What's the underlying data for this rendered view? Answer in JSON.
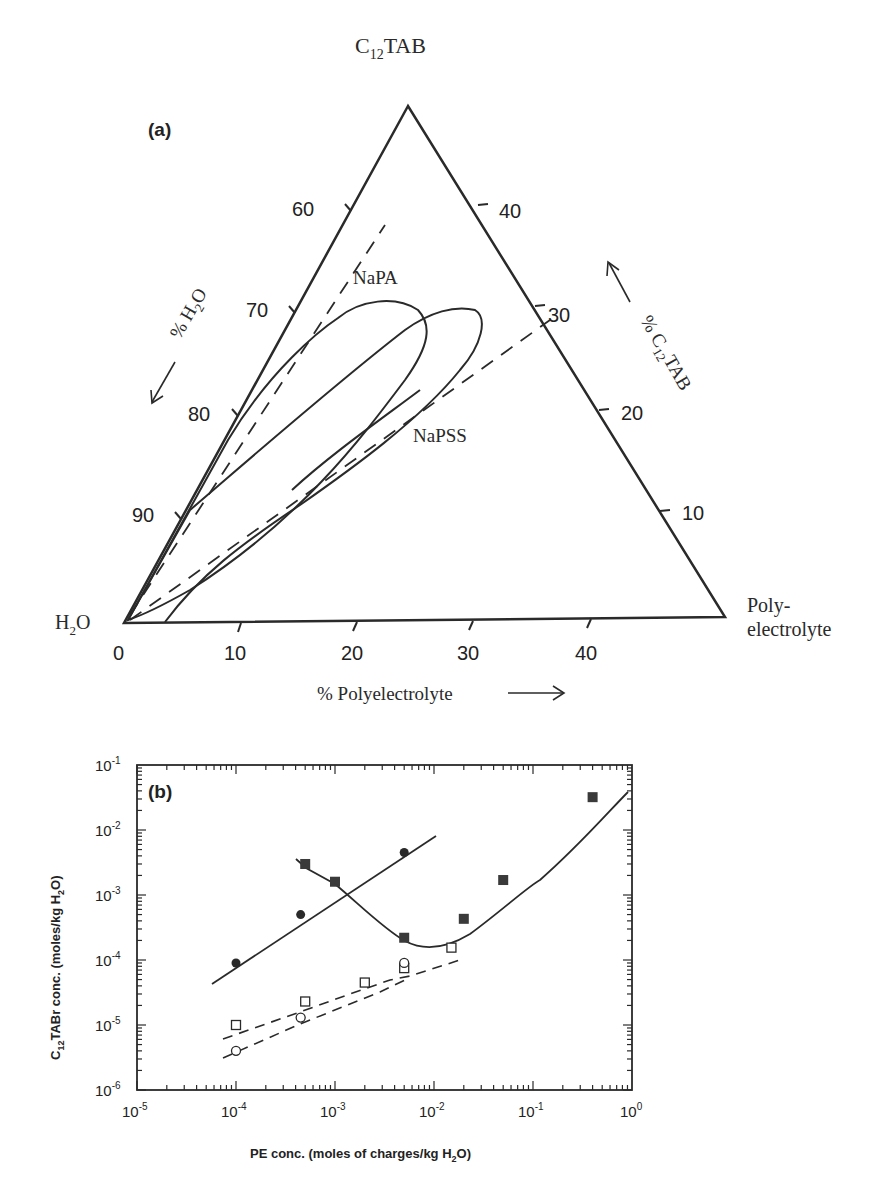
{
  "chart_data": [
    {
      "panel": "(a)",
      "type": "ternary",
      "title": "",
      "vertices": {
        "top": "C12TAB",
        "bottom_left": "H2O",
        "bottom_right": "Poly- electrolyte"
      },
      "axes": {
        "bottom": {
          "label": "% Polyelectrolyte",
          "arrow": "→",
          "ticks": [
            "0",
            "10",
            "20",
            "30",
            "40"
          ]
        },
        "left": {
          "label": "% H2O",
          "arrow": "↙",
          "ticks": [
            "60",
            "70",
            "80",
            "90"
          ]
        },
        "right": {
          "label": "% C12TAB",
          "arrow": "↖",
          "ticks": [
            "40",
            "30",
            "20",
            "10"
          ]
        }
      },
      "series": [
        {
          "name": "NaPA",
          "style": "solid",
          "description": "two-phase region loop, tip near 22% PE / 30% C12TAB"
        },
        {
          "name": "NaPSS",
          "style": "solid",
          "description": "two-phase region loop, tip near 30% PE / 30% C12TAB"
        },
        {
          "name": "stoichiometric line 1",
          "style": "dashed"
        },
        {
          "name": "stoichiometric line 2",
          "style": "dashed"
        }
      ],
      "annotations": [
        "NaPA",
        "NaPSS"
      ]
    },
    {
      "panel": "(b)",
      "type": "scatter",
      "xscale": "log",
      "yscale": "log",
      "xlabel": "PE conc. (moles of charges/kg H2O)",
      "ylabel": "C12TABr conc. (moles/kg H2O)",
      "xlim": [
        1e-05,
        1
      ],
      "ylim": [
        1e-06,
        0.1
      ],
      "xticks": [
        "10^-5",
        "10^-4",
        "10^-3",
        "10^-2",
        "10^-1",
        "10^0"
      ],
      "yticks": [
        "10^-6",
        "10^-5",
        "10^-4",
        "10^-3",
        "10^-2",
        "10^-1"
      ],
      "grid": false,
      "series": [
        {
          "name": "filled circles",
          "marker": "filled-circle",
          "line": "solid",
          "x": [
            0.0001,
            0.00045,
            0.005
          ],
          "y": [
            9e-05,
            0.0005,
            0.0045
          ]
        },
        {
          "name": "filled squares",
          "marker": "filled-square",
          "line": "solid",
          "x": [
            0.0005,
            0.001,
            0.005,
            0.02,
            0.05,
            0.4
          ],
          "y": [
            0.003,
            0.0016,
            0.00022,
            0.00043,
            0.0017,
            0.032
          ]
        },
        {
          "name": "open squares",
          "marker": "open-square",
          "line": "dashed",
          "x": [
            0.0001,
            0.0005,
            0.002,
            0.005,
            0.015
          ],
          "y": [
            1e-05,
            2.3e-05,
            4.5e-05,
            7.5e-05,
            0.000155
          ]
        },
        {
          "name": "open circles",
          "marker": "open-circle",
          "line": "dashed",
          "x": [
            0.0001,
            0.00045,
            0.005
          ],
          "y": [
            4e-06,
            1.3e-05,
            9e-05
          ]
        }
      ]
    }
  ],
  "panel_a": {
    "label": "(a)",
    "vertex_top": {
      "main": "C",
      "sub": "12",
      "rest": "TAB"
    },
    "vertex_left": {
      "main": "H",
      "sub": "2",
      "rest": "O"
    },
    "vertex_right_line1": "Poly-",
    "vertex_right_line2": "electrolyte",
    "bottom_ticks": [
      "0",
      "10",
      "20",
      "30",
      "40"
    ],
    "left_ticks": [
      "60",
      "70",
      "80",
      "90"
    ],
    "right_ticks": [
      "40",
      "30",
      "20",
      "10"
    ],
    "bottom_axis_label": "% Polyelectrolyte",
    "left_axis_label": {
      "main": "% H",
      "sub": "2",
      "rest": "O"
    },
    "right_axis_label": {
      "main": "% C",
      "sub": "12",
      "rest": "TAB"
    },
    "curve_label_1": "NaPA",
    "curve_label_2": "NaPSS"
  },
  "panel_b": {
    "label": "(b)",
    "xlabel": {
      "main": "PE conc. (moles of charges/kg H",
      "sub": "2",
      "rest": "O)"
    },
    "ylabel": {
      "pre": "C",
      "sub1": "12",
      "mid": "TABr conc. (moles/kg H",
      "sub2": "2",
      "rest": "O)"
    },
    "xtick_base": "10",
    "xtick_exps": [
      "-5",
      "-4",
      "-3",
      "-2",
      "-1",
      "0"
    ],
    "ytick_base": "10",
    "ytick_exps": [
      "-1",
      "-2",
      "-3",
      "-4",
      "-5",
      "-6"
    ]
  },
  "colors": {
    "ink": "#2a2a2a",
    "background": "#ffffff"
  }
}
